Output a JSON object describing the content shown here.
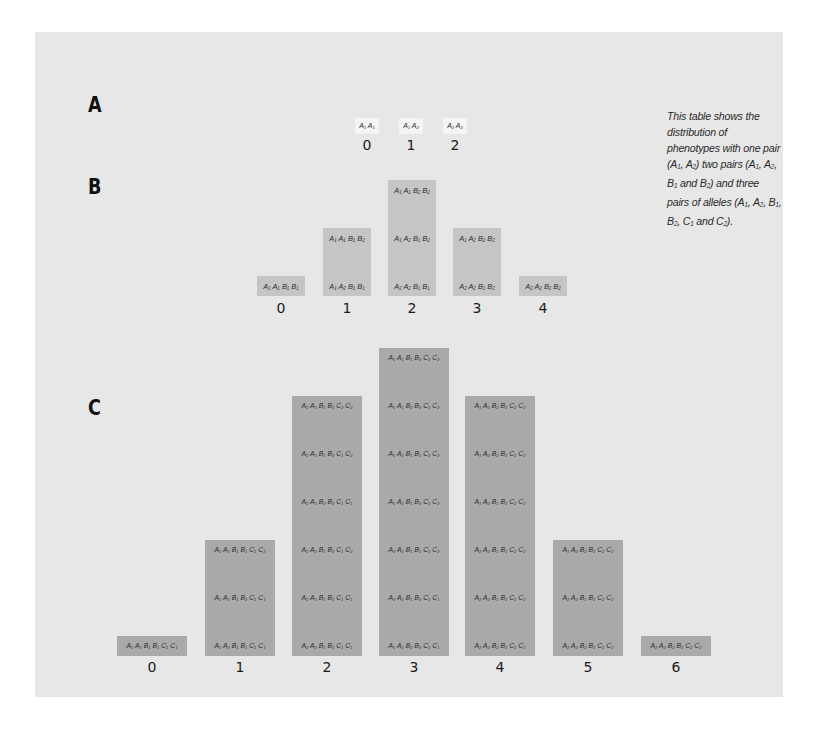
{
  "labels": {
    "a": "A",
    "b": "B",
    "c": "C"
  },
  "note": {
    "parts": [
      {
        "t": "This table shows the distribution of phenotypes with one pair (A"
      },
      {
        "s": "1"
      },
      {
        "t": ", A"
      },
      {
        "s": "2"
      },
      {
        "t": ") two pairs (A"
      },
      {
        "s": "1"
      },
      {
        "t": ", A"
      },
      {
        "s": "2"
      },
      {
        "t": ", B"
      },
      {
        "s": "1"
      },
      {
        "t": " and B"
      },
      {
        "s": "2"
      },
      {
        "t": ") and three pairs of alleles (A"
      },
      {
        "s": "1"
      },
      {
        "t": ", A"
      },
      {
        "s": "2"
      },
      {
        "t": ", B"
      },
      {
        "s": "1"
      },
      {
        "t": ", B"
      },
      {
        "s": "2"
      },
      {
        "t": ", C"
      },
      {
        "s": "1"
      },
      {
        "t": " and C"
      },
      {
        "s": "2"
      },
      {
        "t": ")."
      }
    ]
  },
  "sections": {
    "A": {
      "columns": [
        {
          "number": "0",
          "genotypes": [
            "A1 A1"
          ]
        },
        {
          "number": "1",
          "genotypes": [
            "A1 A2"
          ]
        },
        {
          "number": "2",
          "genotypes": [
            "A2 A2"
          ]
        }
      ]
    },
    "B": {
      "columns": [
        {
          "number": "0",
          "genotypes": [
            "A1 A1 B1 B1"
          ]
        },
        {
          "number": "1",
          "genotypes": [
            "A1 A1 B1 B2",
            "A1 A2 B1 B1"
          ]
        },
        {
          "number": "2",
          "genotypes": [
            "A1 A1 B2 B2",
            "A1 A2 B1 B2",
            "A2 A2 B1 B1"
          ]
        },
        {
          "number": "3",
          "genotypes": [
            "A1 A2 B2 B2",
            "A2 A2 B1 B2"
          ]
        },
        {
          "number": "4",
          "genotypes": [
            "A2 A2 B2 B2"
          ]
        }
      ]
    },
    "C": {
      "columns": [
        {
          "number": "0",
          "genotypes": [
            "A1 A1 B1 B1 C1 C1"
          ]
        },
        {
          "number": "1",
          "genotypes": [
            "A1 A1 B1 B1 C1 C2",
            "A1 A1 B1 B2 C1 C1",
            "A1 A2 B1 B1 C1 C1"
          ]
        },
        {
          "number": "2",
          "genotypes": [
            "A1 A1 B1 B1 C2 C2",
            "A1 A1 B1 B2 C1 C2",
            "A1 A1 B2 B2 C1 C1",
            "A1 A2 B1 B2 C1 C2",
            "A1 A1 B1 B1 C1 C1",
            "A2 A2 B1 B1 C1 C1"
          ]
        },
        {
          "number": "3",
          "genotypes": [
            "A1 A1 B1 B2 C2 C2",
            "A1 A1 B2 B2 C1 C2",
            "A1 A2 B1 B1 C2 C2",
            "A1 A2 B1 B2 C1 C2",
            "A2 A2 B1 B1 C1 C2",
            "A2 A2 B1 B2 C1 C1",
            "A1 A2 B2 B2 C1 C1"
          ]
        },
        {
          "number": "4",
          "genotypes": [
            "A1 A1 B2 B2 C2 C2",
            "A1 A2 B2 B2 C1 C2",
            "A1 A2 B1 B2 C2 C2",
            "A2 A2 B1 B1 C2 C2",
            "A2 A2 B1 B2 C1 C2",
            "A2 A2 B2 B2 C1 C1"
          ]
        },
        {
          "number": "5",
          "genotypes": [
            "A1 A2 B2 B2 C2 C2",
            "A2 A2 B1 B2 C2 C2",
            "A2 A2 B2 B2 C1 C2"
          ]
        },
        {
          "number": "6",
          "genotypes": [
            "A2 A2 B2 B2 C2 C2"
          ]
        }
      ]
    }
  },
  "colors": {
    "panel": "#e7e7e7",
    "boxA": "#f4f4f4",
    "boxB": "#c5c5c5",
    "boxC": "#a9a9a9"
  }
}
